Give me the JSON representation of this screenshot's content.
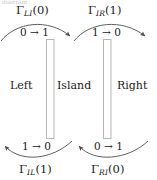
{
  "figure": {
    "title_ghost": "diagram",
    "background_color": "#ffffff",
    "stroke_color": "#4d4d4d",
    "barrier_fill": "#ffffff",
    "barrier_stroke": "#b5b5b5",
    "text_color": "#1a1a1a"
  },
  "regions": [
    {
      "id": "left",
      "label": "Left"
    },
    {
      "id": "island",
      "label": "Island"
    },
    {
      "id": "right",
      "label": "Right"
    }
  ],
  "barriers": [
    {
      "id": "left-barrier",
      "x": 46,
      "y": 39,
      "width": 8,
      "height": 100
    },
    {
      "id": "right-barrier",
      "x": 103,
      "y": 39,
      "width": 8,
      "height": 100
    }
  ],
  "rates": {
    "top_left": {
      "symbol": "Γ",
      "sub": "LI",
      "arg": "(0)",
      "full": "ΓLI(0)"
    },
    "top_right": {
      "symbol": "Γ",
      "sub": "IR",
      "arg": "(1)",
      "full": "ΓIR(1)"
    },
    "bottom_left": {
      "symbol": "Γ",
      "sub": "IL",
      "arg": "(1)",
      "full": "ΓIL(1)"
    },
    "bottom_right": {
      "symbol": "Γ",
      "sub": "RI",
      "arg": "(0)",
      "full": "ΓRI(0)"
    }
  },
  "transitions": {
    "top_left": {
      "from": "0",
      "arrow": "→",
      "to": "1",
      "full": "0 → 1"
    },
    "top_right": {
      "from": "1",
      "arrow": "→",
      "to": "0",
      "full": "1 → 0"
    },
    "bottom_left": {
      "from": "1",
      "arrow": "→",
      "to": "0",
      "full": "1 → 0"
    },
    "bottom_right": {
      "from": "0",
      "arrow": "→",
      "to": "1",
      "full": "0 → 1"
    }
  },
  "arrows": [
    {
      "id": "arc-left-to-island",
      "direction": "rightward",
      "position": "top-left"
    },
    {
      "id": "arc-island-to-right",
      "direction": "rightward",
      "position": "top-right"
    },
    {
      "id": "arc-island-to-left",
      "direction": "leftward",
      "position": "bottom-left"
    },
    {
      "id": "arc-right-to-island",
      "direction": "leftward",
      "position": "bottom-right"
    }
  ]
}
